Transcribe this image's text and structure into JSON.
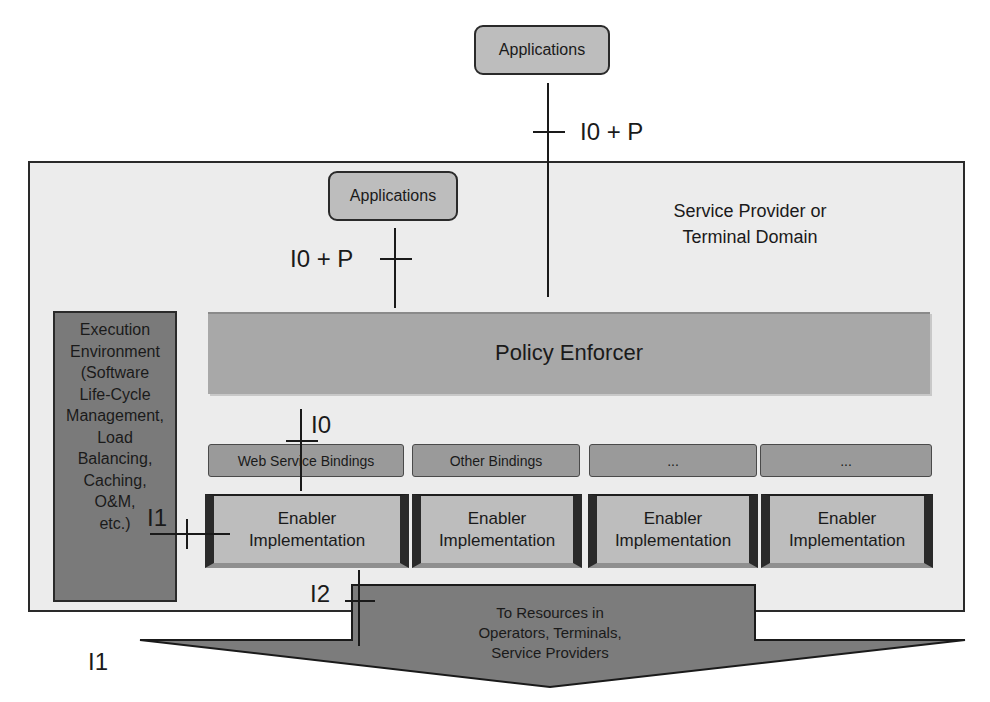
{
  "diagram": {
    "top_application": {
      "label": "Applications",
      "interface": "I0 + P"
    },
    "domain": {
      "label_line1": "Service Provider or",
      "label_line2": "Terminal Domain"
    },
    "inner_application": {
      "label": "Applications",
      "interface": "I0 + P"
    },
    "policy_enforcer": {
      "label": "Policy Enforcer"
    },
    "execution_environment": {
      "lines": [
        "Execution",
        "Environment",
        "(Software",
        "Life-Cycle",
        "Management,",
        "Load",
        "Balancing,",
        "Caching,",
        "O&M,",
        "etc.)"
      ]
    },
    "interfaces": {
      "i0": "I0",
      "i1_exec": "I1",
      "i2": "I2",
      "i1_bottom": "I1"
    },
    "bindings": [
      {
        "label": "Web Service Bindings"
      },
      {
        "label": "Other Bindings"
      },
      {
        "label": "..."
      },
      {
        "label": "..."
      }
    ],
    "enablers": [
      {
        "line1": "Enabler",
        "line2": "Implementation"
      },
      {
        "line1": "Enabler",
        "line2": "Implementation"
      },
      {
        "line1": "Enabler",
        "line2": "Implementation"
      },
      {
        "line1": "Enabler",
        "line2": "Implementation"
      }
    ],
    "resources_arrow": {
      "lines": [
        "To Resources in",
        "Operators, Terminals,",
        "Service Providers"
      ]
    },
    "colors": {
      "domain_bg": "#ececec",
      "box_gray": "#bdbdbd",
      "policy_gray": "#a8a8a8",
      "exec_dark": "#7a7a7a",
      "arrow_dark": "#7c7c7c",
      "line": "#1a1a1a"
    }
  }
}
